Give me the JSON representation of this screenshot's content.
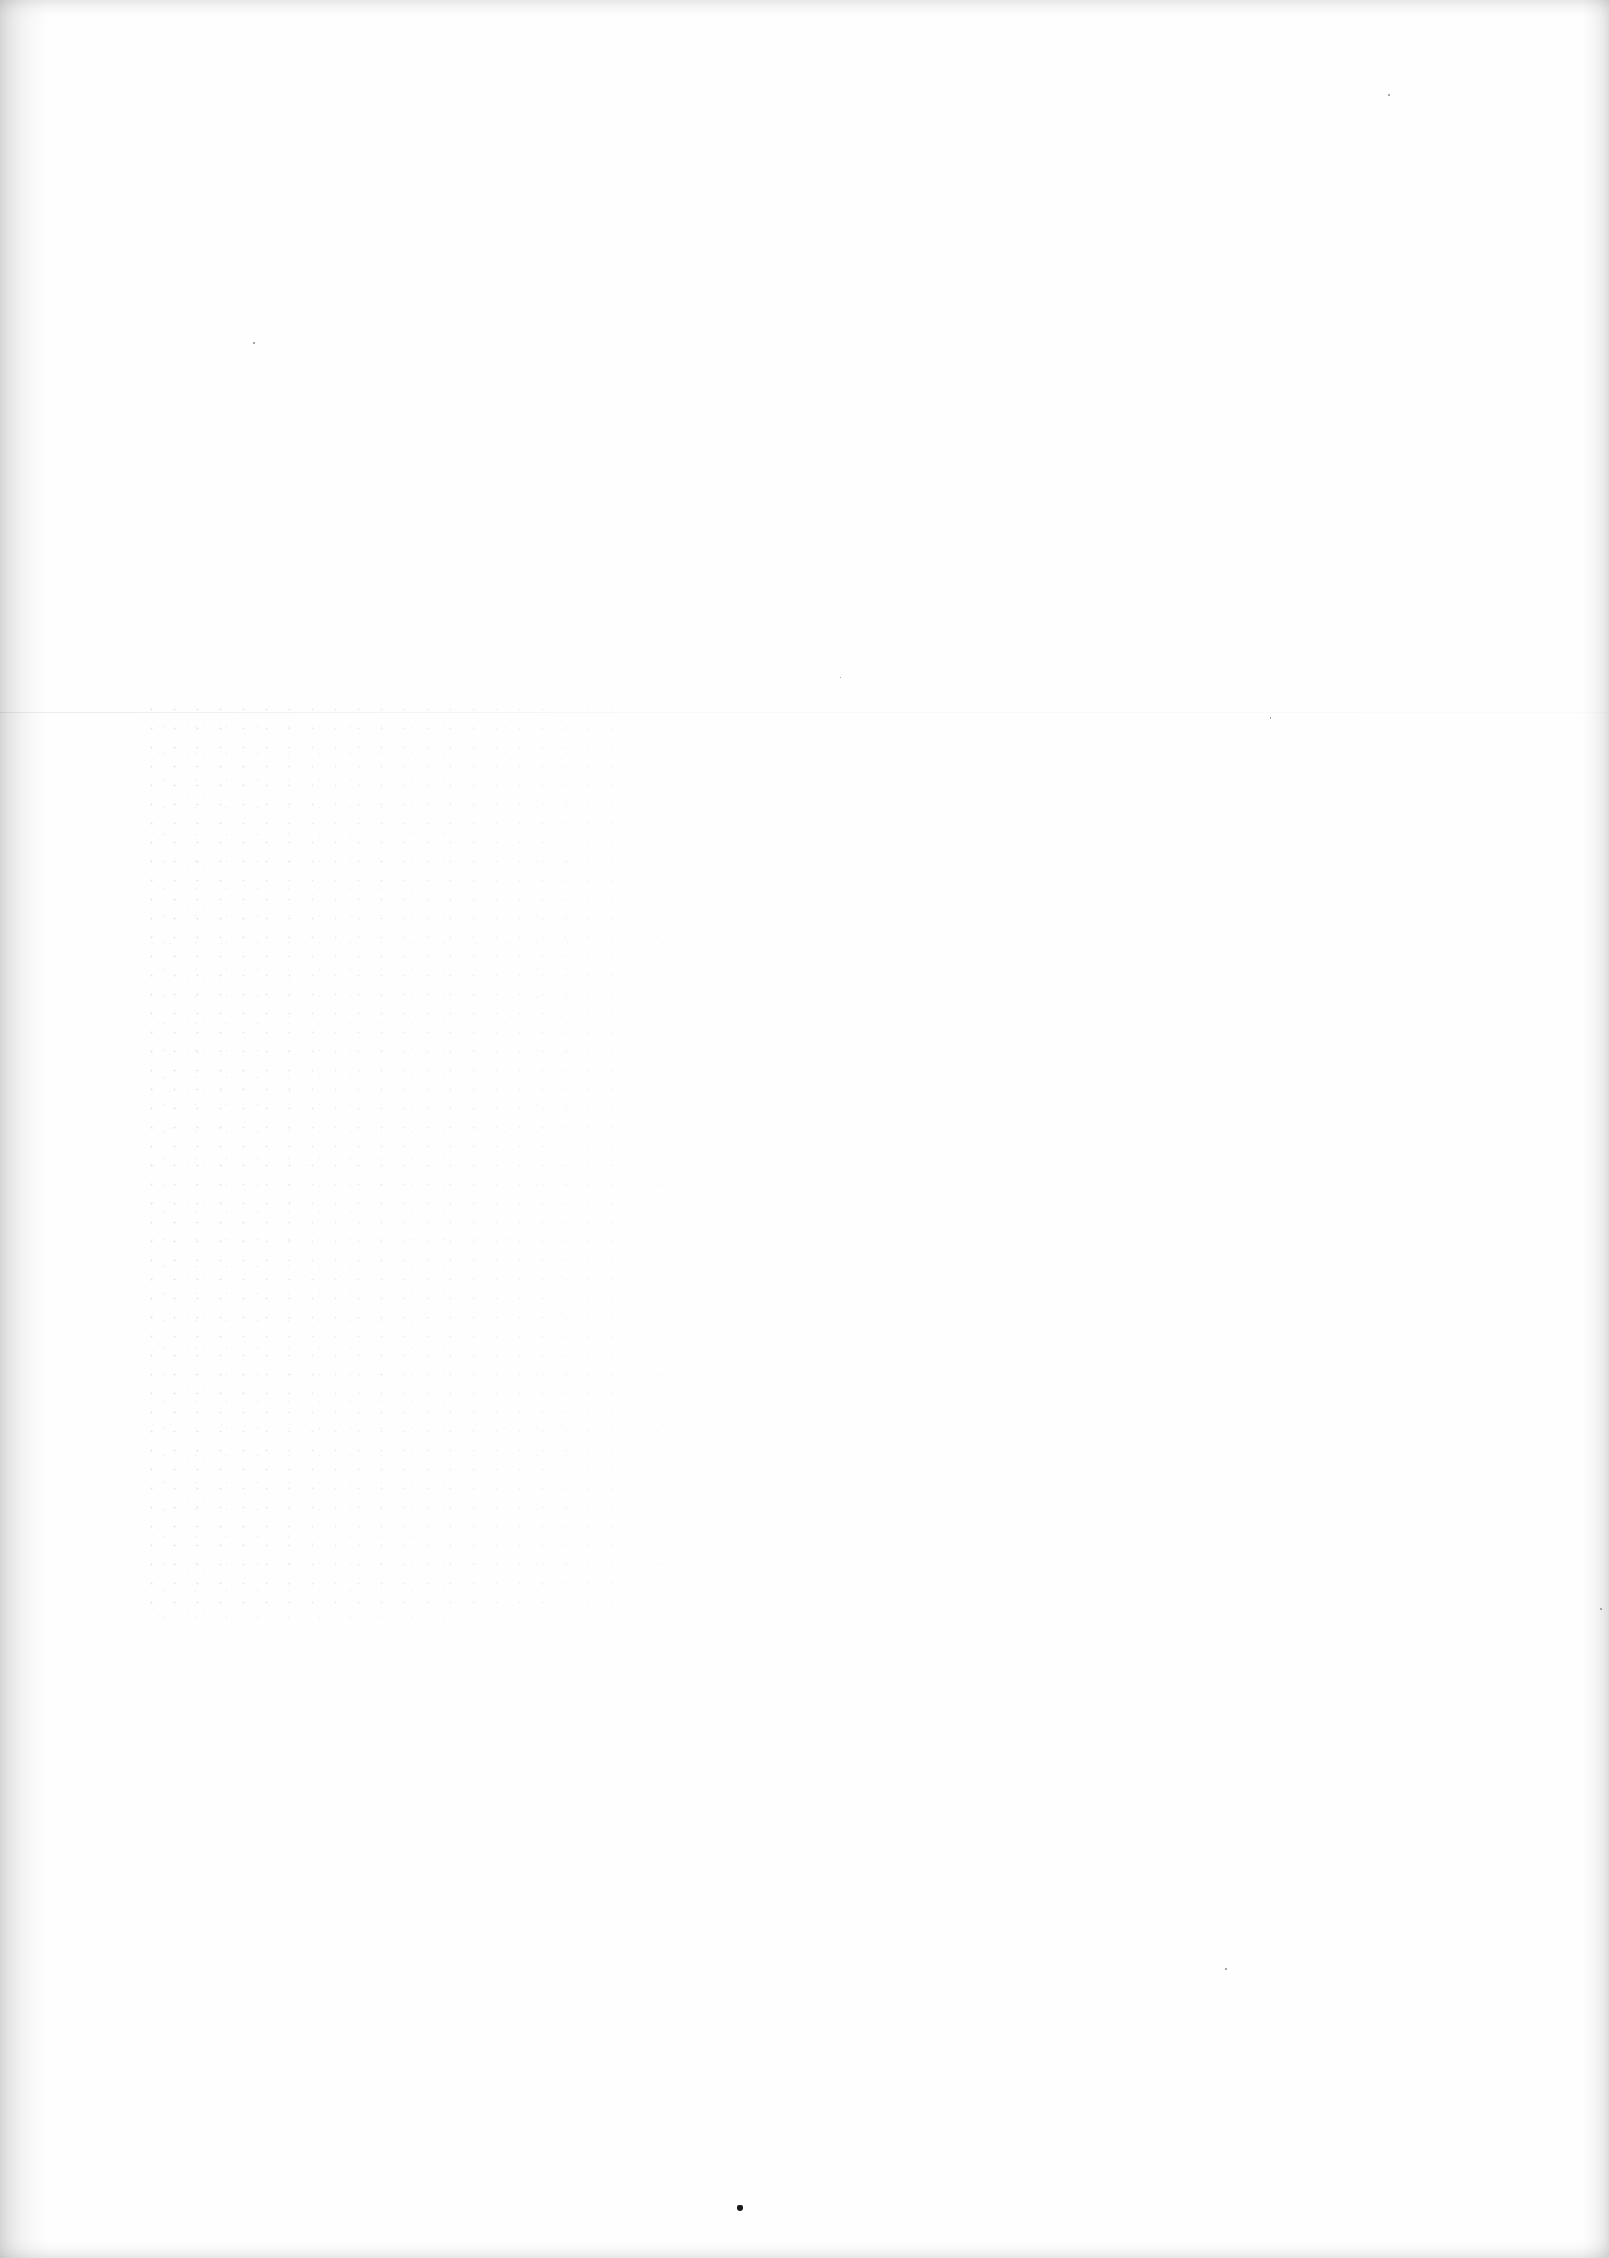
{
  "document": {
    "type": "blank scanned page",
    "text_content": "",
    "colors": {
      "paper": "#fefefe",
      "edge_shadow": "#e6e6e6",
      "mark": "#1a1a1a"
    },
    "features": {
      "fold_line_y": 712,
      "bleed_through_region": [
        140,
        700,
        780,
        1620
      ],
      "bottom_mark": [
        740,
        2208
      ]
    }
  }
}
